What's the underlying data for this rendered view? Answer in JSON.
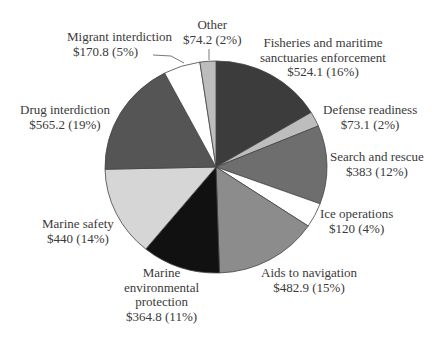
{
  "chart_data": {
    "type": "pie",
    "title": "",
    "unit": "$ millions",
    "start_angle_deg": 0,
    "direction": "clockwise",
    "slices": [
      {
        "name": "Fisheries and maritime sanctuaries enforcement",
        "value": 524.1,
        "percent": 16,
        "color": "#3c3c3c",
        "value_label": "$524.1 (16%)"
      },
      {
        "name": "Defense readiness",
        "value": 73.1,
        "percent": 2,
        "color": "#bdbdbd",
        "value_label": "$73.1 (2%)"
      },
      {
        "name": "Search and rescue",
        "value": 383,
        "percent": 12,
        "color": "#6e6e6e",
        "value_label": "$383 (12%)"
      },
      {
        "name": "Ice operations",
        "value": 120,
        "percent": 4,
        "color": "#ffffff",
        "value_label": "$120 (4%)"
      },
      {
        "name": "Aids to navigation",
        "value": 482.9,
        "percent": 15,
        "color": "#8c8c8c",
        "value_label": "$482.9 (15%)"
      },
      {
        "name": "Marine environmental protection",
        "value": 364.8,
        "percent": 11,
        "color": "#111111",
        "value_label": "$364.8 (11%)"
      },
      {
        "name": "Marine safety",
        "value": 440,
        "percent": 14,
        "color": "#d6d6d6",
        "value_label": "$440 (14%)"
      },
      {
        "name": "Drug interdiction",
        "value": 565.2,
        "percent": 19,
        "color": "#555555",
        "value_label": "$565.2 (19%)"
      },
      {
        "name": "Migrant interdiction",
        "value": 170.8,
        "percent": 5,
        "color": "#ffffff",
        "value_label": "$170.8 (5%)"
      },
      {
        "name": "Other",
        "value": 74.2,
        "percent": 2,
        "color": "#bdbdbd",
        "value_label": "$74.2 (2%)"
      }
    ]
  },
  "labels": {
    "fisheries": {
      "line1": "Fisheries and maritime",
      "line2": "sanctuaries enforcement",
      "line3": "$524.1 (16%)"
    },
    "defense": {
      "line1": "Defense readiness",
      "line2": "$73.1 (2%)"
    },
    "search": {
      "line1": "Search and rescue",
      "line2": "$383 (12%)"
    },
    "ice": {
      "line1": "Ice operations",
      "line2": "$120 (4%)"
    },
    "aids": {
      "line1": "Aids to navigation",
      "line2": "$482.9 (15%)"
    },
    "environmental": {
      "line1": "Marine",
      "line2": "environmental",
      "line3": "protection",
      "line4": "$364.8 (11%)"
    },
    "safety": {
      "line1": "Marine safety",
      "line2": "$440 (14%)"
    },
    "drug": {
      "line1": "Drug interdiction",
      "line2": "$565.2 (19%)"
    },
    "migrant": {
      "line1": "Migrant interdiction",
      "line2": "$170.8 (5%)"
    },
    "other": {
      "line1": "Other",
      "line2": "$74.2 (2%)"
    }
  }
}
